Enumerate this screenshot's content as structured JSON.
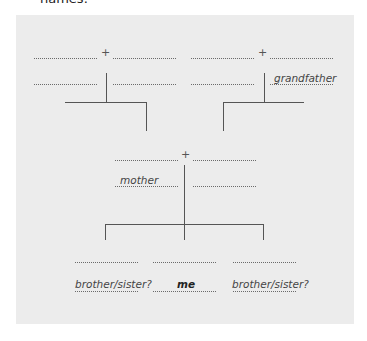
{
  "header": {
    "cut_text": "names."
  },
  "diagram": {
    "type": "family-tree-worksheet",
    "grandparents_left": {
      "couple_symbol": "+",
      "labels": [
        "",
        "",
        "",
        ""
      ]
    },
    "grandparents_right": {
      "couple_symbol": "+",
      "labels": [
        "",
        "",
        "",
        "grandfather"
      ]
    },
    "parents": {
      "couple_symbol": "+",
      "labels": [
        "",
        "",
        "mother",
        ""
      ]
    },
    "children": [
      {
        "label": "brother/sister?",
        "emphasis": false
      },
      {
        "label": "me",
        "emphasis": true
      },
      {
        "label": "brother/sister?",
        "emphasis": false
      }
    ]
  },
  "colors": {
    "panel": "#ececec",
    "lines": "#555555",
    "text": "#444444"
  }
}
